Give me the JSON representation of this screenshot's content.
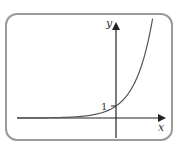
{
  "chart_data": {
    "type": "line",
    "title": "",
    "function": "y = 2^x",
    "xlabel": "x",
    "ylabel": "y",
    "annotations": [
      {
        "text": "1",
        "x": 0,
        "y": 1,
        "note": "y-intercept marked on y-axis"
      }
    ],
    "x": [
      -8,
      -6,
      -4,
      -3,
      -2,
      -1,
      0,
      1,
      2,
      2.5,
      3
    ],
    "series": [
      {
        "name": "exponential curve",
        "values": [
          0.0039,
          0.0156,
          0.0625,
          0.125,
          0.25,
          0.5,
          1,
          2,
          4,
          5.66,
          8
        ]
      }
    ],
    "xlim": [
      -8.25,
      4
    ],
    "ylim": [
      -1.7,
      8
    ],
    "grid": false,
    "legend": null,
    "colors": {
      "curve": "#555555",
      "axes": "#222222",
      "frame": "#9a9a9a"
    }
  },
  "labels": {
    "x_axis": "x",
    "y_axis": "y",
    "intercept": "1"
  }
}
